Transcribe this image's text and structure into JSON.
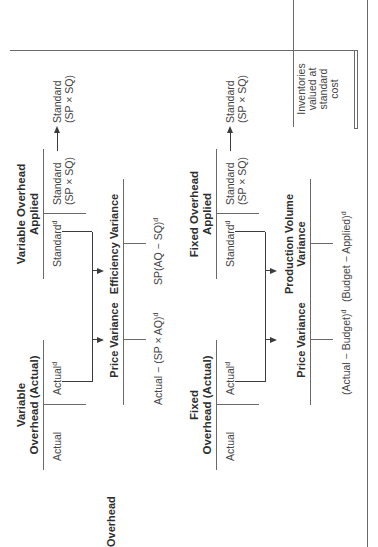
{
  "diagram": {
    "row_label": "Overhead",
    "variable": {
      "actual_account": {
        "title_line1": "Variable",
        "title_line2": "Overhead (Actual)",
        "debit": "Actual",
        "credit": "Actual",
        "credit_sup": "d"
      },
      "applied_account": {
        "title_line1": "Variable Overhead",
        "title_line2": "Applied",
        "debit": "Standard",
        "debit_sup": "d",
        "credit_line1": "Standard",
        "credit_line2": "(SP × SQ)"
      },
      "transfer_target": {
        "line1": "Standard",
        "line2": "(SP × SQ)"
      },
      "price_variance": {
        "title": "Price Variance",
        "formula": "Actual − (SP × AQ)",
        "formula_sup": "d"
      },
      "efficiency_variance": {
        "title": "Efficiency Variance",
        "formula": "SP(AQ − SQ)",
        "formula_sup": "d"
      }
    },
    "fixed": {
      "actual_account": {
        "title_line1": "Fixed",
        "title_line2": "Overhead (Actual)",
        "debit": "Actual",
        "credit": "Actual",
        "credit_sup": "d"
      },
      "applied_account": {
        "title_line1": "Fixed Overhead",
        "title_line2": "Applied",
        "debit": "Standard",
        "debit_sup": "d",
        "credit_line1": "Standard",
        "credit_line2": "(SP × SQ)"
      },
      "transfer_target": {
        "line1": "Standard",
        "line2": "(SP × SQ)"
      },
      "price_variance": {
        "title": "Price Variance",
        "formula": "(Actual − Budget)",
        "formula_sup": "d"
      },
      "production_volume_variance": {
        "title_line1": "Production Volume",
        "title_line2": "Variance",
        "formula": "(Budget − Applied)",
        "formula_sup": "d"
      }
    },
    "inventories_note": {
      "line1": "Inventories",
      "line2": "valued at",
      "line3": "standard",
      "line4": "cost"
    }
  }
}
